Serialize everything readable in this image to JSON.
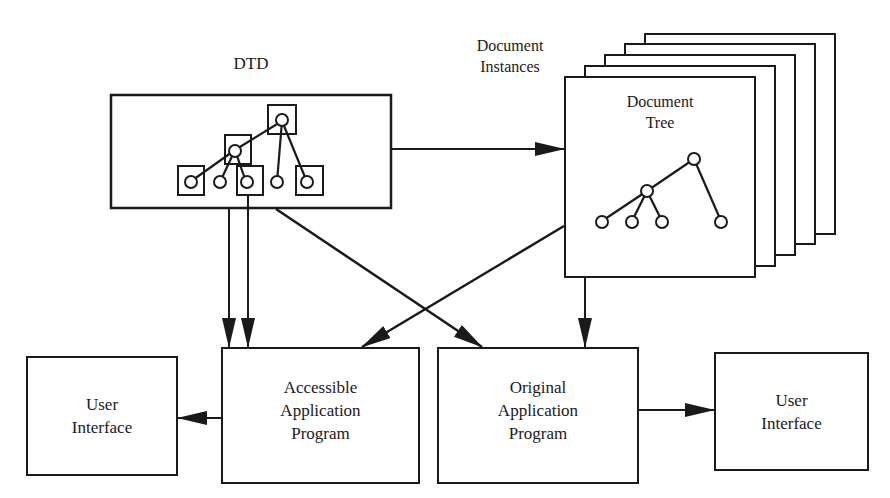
{
  "diagram": {
    "type": "architecture-flow",
    "nodes": {
      "dtd": {
        "label": "DTD"
      },
      "document_instances": {
        "label_line1": "Document",
        "label_line2": "Instances"
      },
      "document_tree": {
        "label_line1": "Document",
        "label_line2": "Tree"
      },
      "accessible_app": {
        "line1": "Accessible",
        "line2": "Application",
        "line3": "Program"
      },
      "original_app": {
        "line1": "Original",
        "line2": "Application",
        "line3": "Program"
      },
      "user_interface_left": {
        "line1": "User",
        "line2": "Interface"
      },
      "user_interface_right": {
        "line1": "User",
        "line2": "Interface"
      }
    },
    "edges": [
      {
        "from": "DTD",
        "to": "Document Tree"
      },
      {
        "from": "DTD",
        "to": "Accessible Application Program",
        "count": 2
      },
      {
        "from": "DTD",
        "to": "Original Application Program"
      },
      {
        "from": "Document Tree",
        "to": "Accessible Application Program"
      },
      {
        "from": "Document Tree",
        "to": "Original Application Program"
      },
      {
        "from": "Accessible Application Program",
        "to": "User Interface (left)"
      },
      {
        "from": "Original Application Program",
        "to": "User Interface (right)"
      }
    ],
    "stroke_color": "#1a1a1a",
    "background_color": "#ffffff"
  }
}
